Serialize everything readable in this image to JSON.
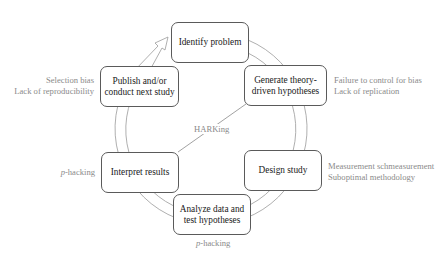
{
  "diagram": {
    "type": "research-cycle",
    "colors": {
      "box_border": "#5a5a5a",
      "box_text": "#1a1a1a",
      "note_text": "#8a8a8a",
      "arc_stroke": "#9a9a9a"
    },
    "steps": [
      {
        "id": "identify",
        "lines": [
          "Identify problem"
        ]
      },
      {
        "id": "generate",
        "lines": [
          "Generate theory-",
          "driven hypotheses"
        ]
      },
      {
        "id": "design",
        "lines": [
          "Design study"
        ]
      },
      {
        "id": "analyze",
        "lines": [
          "Analyze data and",
          "test hypotheses"
        ]
      },
      {
        "id": "interpret",
        "lines": [
          "Interpret results"
        ]
      },
      {
        "id": "publish",
        "lines": [
          "Publish and/or",
          "conduct next study"
        ]
      }
    ],
    "notes": {
      "publish": [
        "Selection bias",
        "Lack of reproducibility"
      ],
      "generate": [
        "Failure to control for bias",
        "Lack of replication"
      ],
      "design": [
        "Measurement schmeasurement",
        "Suboptimal methodology"
      ],
      "interpret": {
        "italic": "p",
        "rest": "-hacking"
      },
      "analyze": {
        "italic": "p",
        "rest": "-hacking"
      }
    },
    "connector": {
      "label": "HARKing",
      "from": "interpret",
      "to": "generate"
    }
  }
}
